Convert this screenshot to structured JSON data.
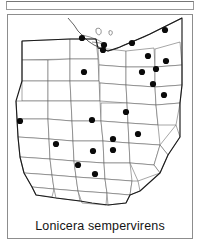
{
  "figure": {
    "caption": "Lonicera sempervirens",
    "map_region": "Ohio",
    "symbol_legend": "filled-circle = county record",
    "colors": {
      "dot": "#0a0a0a",
      "county_line": "#5c5c5c",
      "state_outline": "#1b1b1b",
      "frame": "#8d8d8d",
      "background": "#ffffff"
    }
  },
  "chart_data": {
    "type": "scatter",
    "title": "Lonicera sempervirens",
    "subtitle": "",
    "xlabel": "",
    "ylabel": "",
    "grid": false,
    "legend": "none",
    "basemap": "Ohio county outline map",
    "units": "map coordinates (px within 184x196 map area)",
    "xlim": [
      0,
      184
    ],
    "ylim": [
      0,
      196
    ],
    "point_count": 22,
    "points": [
      {
        "id": 1,
        "x": 74,
        "y": 23,
        "label": "record"
      },
      {
        "id": 2,
        "x": 95,
        "y": 35,
        "label": "record"
      },
      {
        "id": 3,
        "x": 124,
        "y": 28,
        "label": "record"
      },
      {
        "id": 4,
        "x": 157,
        "y": 15,
        "label": "record"
      },
      {
        "id": 5,
        "x": 140,
        "y": 41,
        "label": "record"
      },
      {
        "id": 6,
        "x": 158,
        "y": 46,
        "label": "record"
      },
      {
        "id": 7,
        "x": 76,
        "y": 57,
        "label": "record"
      },
      {
        "id": 8,
        "x": 134,
        "y": 57,
        "label": "record"
      },
      {
        "id": 9,
        "x": 145,
        "y": 69,
        "label": "record"
      },
      {
        "id": 10,
        "x": 156,
        "y": 80,
        "label": "record"
      },
      {
        "id": 11,
        "x": 12,
        "y": 106,
        "label": "record"
      },
      {
        "id": 12,
        "x": 84,
        "y": 105,
        "label": "record"
      },
      {
        "id": 13,
        "x": 130,
        "y": 119,
        "label": "record"
      },
      {
        "id": 14,
        "x": 105,
        "y": 124,
        "label": "record"
      },
      {
        "id": 15,
        "x": 48,
        "y": 129,
        "label": "record"
      },
      {
        "id": 16,
        "x": 85,
        "y": 136,
        "label": "record"
      },
      {
        "id": 17,
        "x": 105,
        "y": 135,
        "label": "record"
      },
      {
        "id": 18,
        "x": 70,
        "y": 150,
        "label": "record"
      },
      {
        "id": 19,
        "x": 87,
        "y": 159,
        "label": "record"
      },
      {
        "id": 20,
        "x": 118,
        "y": 97,
        "label": "record"
      },
      {
        "id": 21,
        "x": 148,
        "y": 54,
        "label": "record"
      },
      {
        "id": 22,
        "x": 96,
        "y": 30,
        "label": "record"
      }
    ]
  }
}
